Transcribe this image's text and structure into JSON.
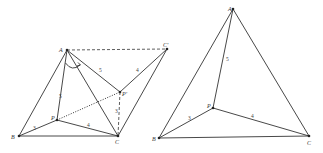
{
  "figures": [
    {
      "id": "left",
      "description": "Rotation construction: triangle APB rotated about A to AP'C'",
      "points": {
        "A": "A",
        "B": "B",
        "C": "C",
        "P": "P",
        "P_prime": "P'",
        "C_prime": "C'"
      },
      "segment_labels": {
        "AP": "5",
        "PB": "3",
        "PC": "4",
        "AP_prime": "5",
        "P_prime_C_prime": "4",
        "PP_prime": "",
        "P_prime_C": "3"
      }
    },
    {
      "id": "right",
      "description": "Triangle ABC with interior point P",
      "points": {
        "A": "A",
        "B": "B",
        "C": "C",
        "P": "P"
      },
      "segment_labels": {
        "AP": "5",
        "PB": "3",
        "PC": "4"
      }
    }
  ]
}
